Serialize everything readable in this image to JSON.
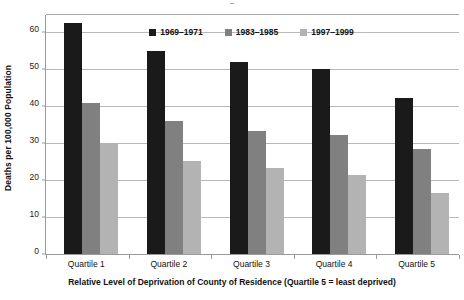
{
  "figure": {
    "cropped_title_fragment": "¨",
    "background_color": "#ffffff"
  },
  "axes": {
    "y_title": "Deaths per 100,000 Population",
    "x_title": "Relative Level of Deprivation of County of Residence (Quartile 5 = least deprived)",
    "y_ticks": [
      "0",
      "10",
      "20",
      "30",
      "40",
      "50",
      "60"
    ],
    "x_ticks": [
      "Quartile 1",
      "Quartile 2",
      "Quartile 3",
      "Quartile 4",
      "Quartile 5"
    ]
  },
  "legend": {
    "items": [
      {
        "label": "1969–1971",
        "color": "#1a1a1a"
      },
      {
        "label": "1983–1985",
        "color": "#808080"
      },
      {
        "label": "1997–1999",
        "color": "#b3b3b3"
      }
    ]
  },
  "colors": {
    "series_1": "#1a1a1a",
    "series_2": "#808080",
    "series_3": "#b3b3b3",
    "gridline": "#b9b9b9",
    "axis": "#9a9a9a",
    "text": "#111111"
  },
  "chart_data": {
    "type": "bar",
    "title": "",
    "xlabel": "Relative Level of Deprivation of County of Residence (Quartile 5 = least deprived)",
    "ylabel": "Deaths per 100,000 Population",
    "categories": [
      "Quartile 1",
      "Quartile 2",
      "Quartile 3",
      "Quartile 4",
      "Quartile 5"
    ],
    "series": [
      {
        "name": "1969–1971",
        "color": "#1a1a1a",
        "values": [
          62.7,
          55.0,
          52.1,
          50.2,
          42.3
        ]
      },
      {
        "name": "1983–1985",
        "color": "#808080",
        "values": [
          41.0,
          36.0,
          33.2,
          32.2,
          28.4
        ]
      },
      {
        "name": "1997–1999",
        "color": "#b3b3b3",
        "values": [
          30.0,
          25.1,
          23.2,
          21.3,
          16.4
        ]
      }
    ],
    "ylim": [
      0,
      65
    ],
    "yticks": [
      0,
      10,
      20,
      30,
      40,
      50,
      60
    ],
    "grid": true,
    "legend_position": "top-center",
    "orientation": "vertical",
    "grouping": "grouped"
  }
}
